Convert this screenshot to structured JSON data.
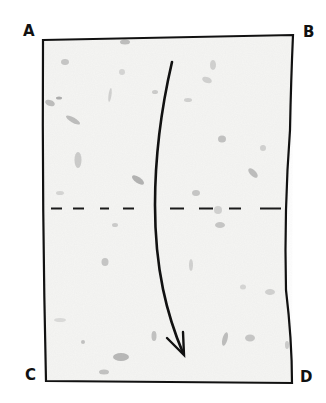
{
  "diagram": {
    "type": "paper-folding-instruction",
    "paper": {
      "fill": "#f4f4f2",
      "texture": "speckled handmade paper with gray fiber flecks",
      "outline_color": "#111111"
    },
    "corners": {
      "top_left": {
        "label": "A"
      },
      "top_right": {
        "label": "B"
      },
      "bottom_left": {
        "label": "C"
      },
      "bottom_right": {
        "label": "D"
      }
    },
    "fold_line": {
      "style": "dashed",
      "orientation": "horizontal",
      "position": "middle",
      "color": "#1a1a1a"
    },
    "arrow": {
      "direction": "down",
      "meaning": "fold top edge A-B down to bottom edge C-D",
      "color": "#111111"
    }
  }
}
